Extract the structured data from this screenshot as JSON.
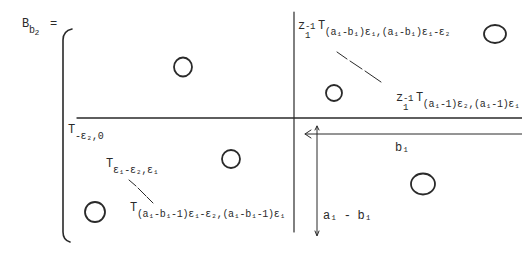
{
  "matrix": {
    "lhs": {
      "base": "B",
      "sub": "b",
      "subsub": "2",
      "eq": "="
    },
    "top_right": {
      "label1": {
        "prefix": "z",
        "prefix_sub": "1",
        "prefix_sup": "-1",
        "T": "T",
        "sub_text": "(a₁-b₁)ε₁,(a₁-b₁)ε₁-ε₂"
      },
      "label2": {
        "prefix": "z",
        "prefix_sub": "1",
        "prefix_sup": "-1",
        "T": "T",
        "sub_text": "(a₁-1)ε₂,(a₁-1)ε₁"
      }
    },
    "bottom_left": {
      "label0": {
        "T": "T",
        "sub_text": "-ε₂,0"
      },
      "label1": {
        "T": "T",
        "sub_text": "ε₁-ε₂,ε₁"
      },
      "label2": {
        "T": "T",
        "sub_text": "(a₁-b₁-1)ε₁-ε₂,(a₁-b₁-1)ε₁"
      }
    },
    "dimensions": {
      "width_label": "b₁",
      "height_label": "a₁ - b₁"
    },
    "zero_blocks": [
      {
        "name": "top-left",
        "symbol": "O"
      },
      {
        "name": "top-right-corner",
        "symbol": "O"
      },
      {
        "name": "top-right-inner",
        "symbol": "O"
      },
      {
        "name": "bottom-left-middle",
        "symbol": "O"
      },
      {
        "name": "bottom-left-corner",
        "symbol": "O"
      },
      {
        "name": "bottom-right",
        "symbol": "O"
      }
    ]
  }
}
